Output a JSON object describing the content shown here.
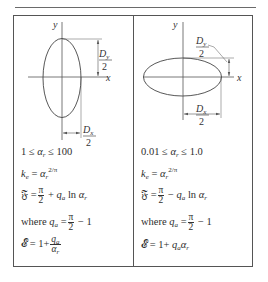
{
  "figure": {
    "left_panel": {
      "axis_labels": {
        "y": "y",
        "x": "x"
      },
      "dims": {
        "dy": {
          "num": "D",
          "sub": "y",
          "den": "2"
        },
        "dx": {
          "num": "D",
          "sub": "x",
          "den": "2"
        }
      },
      "range": {
        "low": "1",
        "var": "α",
        "sub": "r",
        "high": "100"
      },
      "ke": {
        "lhs": "k",
        "lhs_sub": "e",
        "base": "α",
        "base_sub": "r",
        "exp": "2/π"
      },
      "F": {
        "lhs": "𝔉",
        "pi": "π",
        "two": "2",
        "op": "+",
        "q": "q",
        "q_sub": "a",
        "ln": "ln",
        "var": "α",
        "var_sub": "r"
      },
      "where": {
        "word": "where",
        "q": "q",
        "q_sub": "a",
        "pi": "π",
        "two": "2",
        "tail": "− 1"
      },
      "E": {
        "lhs": "𝓔",
        "eq": "= 1+",
        "num": "q",
        "num_sub": "a",
        "den": "α",
        "den_sub": "r"
      }
    },
    "right_panel": {
      "axis_labels": {
        "y": "y",
        "x": "x"
      },
      "dims": {
        "dy": {
          "num": "D",
          "sub": "y",
          "den": "2"
        },
        "dx": {
          "num": "D",
          "sub": "x",
          "den": "2"
        }
      },
      "range": {
        "low": "0.01",
        "var": "α",
        "sub": "r",
        "high": "1.0"
      },
      "ke": {
        "lhs": "k",
        "lhs_sub": "e",
        "base": "α",
        "base_sub": "r",
        "exp": "2/π"
      },
      "F": {
        "lhs": "𝔉",
        "pi": "π",
        "two": "2",
        "op": "−",
        "q": "q",
        "q_sub": "a",
        "ln": "ln",
        "var": "α",
        "var_sub": "r"
      },
      "where": {
        "word": "where",
        "q": "q",
        "q_sub": "a",
        "pi": "π",
        "two": "2",
        "tail": "− 1"
      },
      "E": {
        "lhs": "𝓔",
        "eq": "= 1+",
        "q": "q",
        "q_sub": "a",
        "var": "α",
        "var_sub": "r"
      }
    },
    "colors": {
      "line": "#555555",
      "text": "#2e2e2e"
    }
  }
}
